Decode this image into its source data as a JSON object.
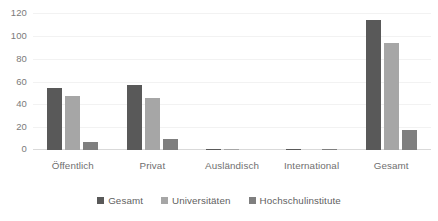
{
  "chart_data": {
    "type": "bar",
    "title": "",
    "subtitle": "",
    "xlabel": "",
    "ylabel": "",
    "categories": [
      "Öffentlich",
      "Privat",
      "Ausländisch",
      "International",
      "Gesamt"
    ],
    "series": [
      {
        "name": "Gesamt",
        "color": "#595959",
        "values": [
          55,
          57,
          1,
          1,
          115
        ]
      },
      {
        "name": "Universitäten",
        "color": "#a6a6a6",
        "values": [
          48,
          46,
          1,
          0,
          94
        ]
      },
      {
        "name": "Hochschulinstitute",
        "color": "#7f7f7f",
        "values": [
          7,
          10,
          0,
          1,
          18
        ]
      }
    ],
    "ylim": [
      0,
      120
    ],
    "yticks": [
      0,
      20,
      40,
      60,
      80,
      100,
      120
    ],
    "ytick_labels": [
      "0",
      "20",
      "40",
      "60",
      "80",
      "100",
      "120"
    ],
    "grid": true,
    "grid_axis": "y",
    "legend_position": "bottom",
    "annotations": []
  },
  "colors": {
    "background": "#ffffff",
    "gridline": "#f2f2f2",
    "baseline": "#d9d9d9",
    "tick_text": "#7a7a7a",
    "axis_text": "#6f6f6f",
    "legend_text": "#5f5f5f"
  }
}
